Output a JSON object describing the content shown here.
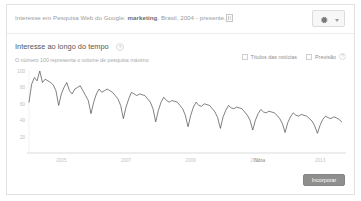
{
  "header": {
    "prefix": "Interesse em Pesquisa Web do Google:",
    "keyword": "marketing",
    "suffix": ", Brasil, 2004 - presente.",
    "embed_icon": "embed-icon",
    "gear_icon": "gear-icon",
    "caret_icon": "chevron-down-icon"
  },
  "section": {
    "title": "Interesse ao longo do tempo",
    "help_icon_label": "?",
    "subtitle": "O número 100 representa o volume de pesquisa máximo"
  },
  "toggles": [
    {
      "label": "Títulos das notícias",
      "checked": false,
      "info": false
    },
    {
      "label": "Previsão",
      "checked": false,
      "info": true,
      "info_icon_label": "?"
    }
  ],
  "footer": {
    "embed_button_label": "Incorporar"
  },
  "annotations": [
    {
      "label": "Nota",
      "x": 255
    }
  ],
  "chart_data": {
    "type": "line",
    "title": "Interesse ao longo do tempo",
    "subtitle": "O número 100 representa o volume de pesquisa máximo",
    "xlabel": "",
    "ylabel": "",
    "ylim": [
      0,
      100
    ],
    "yticks": [
      100,
      80,
      60,
      40,
      20
    ],
    "ytick_labels": [
      "100",
      "80",
      "60",
      "40",
      "20"
    ],
    "xtick_labels": [
      "2005",
      "2007",
      "2009",
      "2011",
      "2013"
    ],
    "xtick_positions": [
      2005,
      2007,
      2009,
      2011,
      2013
    ],
    "grid": false,
    "legend": "none",
    "line_color": "#4a4a4a",
    "axis_color": "#cccccc",
    "x_start": 2004,
    "x_end": 2013.8,
    "series": [
      {
        "name": "marketing",
        "x": [
          2004.0,
          2004.083,
          2004.167,
          2004.25,
          2004.333,
          2004.417,
          2004.5,
          2004.583,
          2004.667,
          2004.75,
          2004.833,
          2004.917,
          2005.0,
          2005.083,
          2005.167,
          2005.25,
          2005.333,
          2005.417,
          2005.5,
          2005.583,
          2005.667,
          2005.75,
          2005.833,
          2005.917,
          2006.0,
          2006.083,
          2006.167,
          2006.25,
          2006.333,
          2006.417,
          2006.5,
          2006.583,
          2006.667,
          2006.75,
          2006.833,
          2006.917,
          2007.0,
          2007.083,
          2007.167,
          2007.25,
          2007.333,
          2007.417,
          2007.5,
          2007.583,
          2007.667,
          2007.75,
          2007.833,
          2007.917,
          2008.0,
          2008.083,
          2008.167,
          2008.25,
          2008.333,
          2008.417,
          2008.5,
          2008.583,
          2008.667,
          2008.75,
          2008.833,
          2008.917,
          2009.0,
          2009.083,
          2009.167,
          2009.25,
          2009.333,
          2009.417,
          2009.5,
          2009.583,
          2009.667,
          2009.75,
          2009.833,
          2009.917,
          2010.0,
          2010.083,
          2010.167,
          2010.25,
          2010.333,
          2010.417,
          2010.5,
          2010.583,
          2010.667,
          2010.75,
          2010.833,
          2010.917,
          2011.0,
          2011.083,
          2011.167,
          2011.25,
          2011.333,
          2011.417,
          2011.5,
          2011.583,
          2011.667,
          2011.75,
          2011.833,
          2011.917,
          2012.0,
          2012.083,
          2012.167,
          2012.25,
          2012.333,
          2012.417,
          2012.5,
          2012.583,
          2012.667,
          2012.75,
          2012.833,
          2012.917,
          2013.0,
          2013.083,
          2013.167,
          2013.25,
          2013.333,
          2013.417,
          2013.5,
          2013.583,
          2013.667
        ],
        "values": [
          62,
          84,
          92,
          88,
          100,
          86,
          90,
          88,
          86,
          83,
          76,
          58,
          72,
          80,
          86,
          76,
          72,
          78,
          80,
          82,
          76,
          70,
          64,
          48,
          62,
          72,
          78,
          74,
          76,
          78,
          76,
          74,
          70,
          66,
          58,
          42,
          56,
          66,
          74,
          72,
          70,
          72,
          71,
          70,
          66,
          62,
          54,
          38,
          52,
          62,
          68,
          64,
          62,
          64,
          63,
          62,
          58,
          54,
          46,
          32,
          46,
          56,
          62,
          58,
          57,
          60,
          59,
          58,
          54,
          50,
          43,
          30,
          44,
          52,
          58,
          55,
          54,
          56,
          55,
          54,
          50,
          46,
          40,
          28,
          40,
          48,
          53,
          50,
          49,
          51,
          50,
          49,
          46,
          42,
          36,
          25,
          37,
          44,
          49,
          46,
          45,
          47,
          46,
          45,
          42,
          39,
          33,
          24,
          34,
          41,
          45,
          43,
          42,
          44,
          43,
          41,
          38
        ]
      }
    ]
  }
}
